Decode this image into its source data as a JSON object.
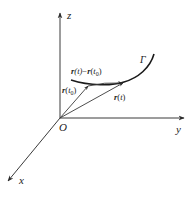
{
  "diagram": {
    "type": "vector-valued function in 3D space",
    "colors": {
      "stroke": "#3a3a3a",
      "text": "#222222",
      "background": "#ffffff"
    },
    "axes": {
      "origin_label": "O",
      "x_label": "x",
      "y_label": "y",
      "z_label": "z"
    },
    "curve": {
      "label": "Γ"
    },
    "vectors": {
      "r_t0": {
        "main": "r",
        "arg_open": "(",
        "arg": "t",
        "sub": "0",
        "arg_close": ")"
      },
      "r_t": {
        "main": "r",
        "arg_open": "(",
        "arg": "t",
        "arg_close": ")"
      },
      "difference": {
        "a_main": "r",
        "a_arg": "(t)",
        "minus": "−",
        "b_main": "r",
        "b_arg_open": "(",
        "b_arg": "t",
        "b_sub": "0",
        "b_arg_close": ")"
      }
    }
  }
}
